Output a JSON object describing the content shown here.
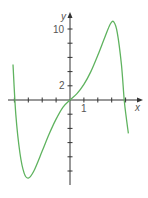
{
  "chart_data": {
    "type": "line",
    "title": "",
    "xlabel": "x",
    "ylabel": "y",
    "x_tick_labels": [
      "1"
    ],
    "y_tick_labels": [
      "2",
      "10"
    ],
    "x_ticks": [
      -4,
      -3,
      -2,
      -1,
      1,
      2,
      3,
      4
    ],
    "y_ticks": [
      -10,
      -8,
      -6,
      -4,
      -2,
      2,
      4,
      6,
      8,
      10
    ],
    "xlim": [
      -4.5,
      5
    ],
    "ylim": [
      -12,
      12
    ],
    "grid": false,
    "legend": null,
    "series": [
      {
        "name": "curve",
        "color": "#5fb35f",
        "points": [
          [
            -4.1,
            5.0
          ],
          [
            -3.9,
            -2.0
          ],
          [
            -3.6,
            -7.5
          ],
          [
            -3.3,
            -10.3
          ],
          [
            -3.0,
            -11.0
          ],
          [
            -2.6,
            -10.0
          ],
          [
            -2.0,
            -7.2
          ],
          [
            -1.5,
            -4.8
          ],
          [
            -1.0,
            -2.7
          ],
          [
            -0.5,
            -1.0
          ],
          [
            0.0,
            0.0
          ],
          [
            0.5,
            0.9
          ],
          [
            1.0,
            2.2
          ],
          [
            1.5,
            4.0
          ],
          [
            2.0,
            6.3
          ],
          [
            2.5,
            8.8
          ],
          [
            2.9,
            10.7
          ],
          [
            3.15,
            11.0
          ],
          [
            3.4,
            9.5
          ],
          [
            3.7,
            5.0
          ],
          [
            3.9,
            0.0
          ],
          [
            4.05,
            -2.5
          ],
          [
            4.2,
            -4.7
          ]
        ]
      }
    ]
  },
  "axes": {
    "x_label": "x",
    "y_label": "y",
    "x_tick_label_1": "1",
    "y_tick_label_2": "2",
    "y_tick_label_10": "10",
    "axis_color": "#333333"
  }
}
